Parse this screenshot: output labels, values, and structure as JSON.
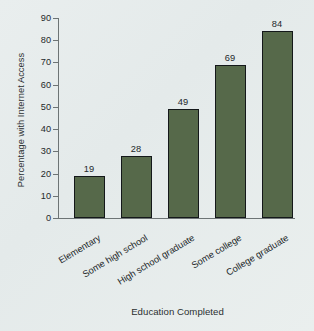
{
  "chart_data": {
    "type": "bar",
    "title": "",
    "xlabel": "Education Completed",
    "ylabel": "Percentage with Internet Access",
    "categories": [
      "Elementary",
      "Some high school",
      "High school graduate",
      "Some college",
      "College graduate"
    ],
    "values": [
      19,
      28,
      49,
      69,
      84
    ],
    "value_labels": [
      "19",
      "28",
      "49",
      "69",
      "84"
    ],
    "ylim": [
      0,
      90
    ],
    "ytick_labels": [
      "0",
      "10",
      "20",
      "30",
      "40",
      "50",
      "60",
      "70",
      "80",
      "90"
    ],
    "ytick_values": [
      0,
      10,
      20,
      30,
      40,
      50,
      60,
      70,
      80,
      90
    ],
    "grid": false,
    "legend": false,
    "legend_position": "none",
    "bar_color": "#56694a",
    "bar_edge_color": "#14181a",
    "background_color": "#e7ecec",
    "axis_color": "#6d7475",
    "text_color": "#23282a"
  }
}
